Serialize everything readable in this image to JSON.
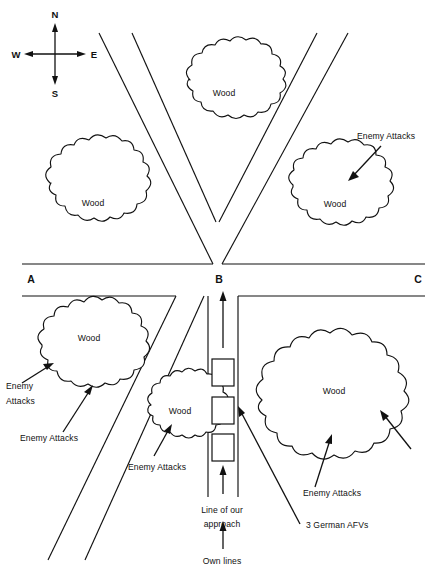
{
  "diagram": {
    "line_color": "#111111",
    "background_color": "#ffffff",
    "compass": {
      "north": "N",
      "south": "S",
      "east": "E",
      "west": "W"
    },
    "junctions": [
      {
        "id": "A",
        "label": "A"
      },
      {
        "id": "B",
        "label": "B"
      },
      {
        "id": "C",
        "label": "C"
      }
    ],
    "woods": [
      {
        "id": "wood-upper-left",
        "label": "Wood"
      },
      {
        "id": "wood-upper-center",
        "label": "Wood"
      },
      {
        "id": "wood-upper-right",
        "label": "Wood"
      },
      {
        "id": "wood-lower-left",
        "label": "Wood"
      },
      {
        "id": "wood-lower-center-small",
        "label": "Wood"
      },
      {
        "id": "wood-lower-right-large",
        "label": "Wood"
      }
    ],
    "annotations": [
      {
        "id": "enemy-attacks-upper-right",
        "label": "Enemy Attacks"
      },
      {
        "id": "enemy-attacks-lower-left-upper",
        "line1": "Enemy",
        "line2": "Attacks"
      },
      {
        "id": "enemy-attacks-lower-left-lower",
        "label": "Enemy Attacks"
      },
      {
        "id": "enemy-attacks-lower-center",
        "label": "Enemy Attacks"
      },
      {
        "id": "enemy-attacks-lower-right",
        "label": "Enemy Attacks"
      },
      {
        "id": "line-of-our-approach",
        "line1": "Line of our",
        "line2": "approach"
      },
      {
        "id": "own-lines",
        "label": "Own lines"
      },
      {
        "id": "three-german-afvs",
        "label": "3 German AFVs"
      }
    ],
    "afv_markers": {
      "count": 3,
      "label": "3 German AFVs"
    }
  }
}
